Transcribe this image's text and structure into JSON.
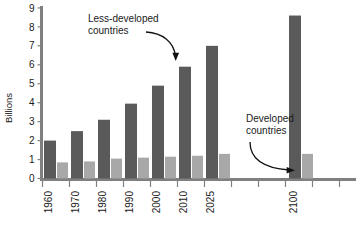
{
  "chart_data": {
    "type": "bar",
    "title": "",
    "xlabel": "",
    "ylabel": "Billions",
    "ylim": [
      0,
      9.4
    ],
    "yticks": [
      0,
      1,
      2,
      3,
      4,
      5,
      6,
      7,
      8,
      9
    ],
    "ytick_labels": [
      "0",
      "1",
      "2",
      "3",
      "4",
      "5",
      "6",
      "7",
      "8",
      "9"
    ],
    "grid": false,
    "legend_position": "annotations",
    "categories": [
      "1960",
      "1970",
      "1980",
      "1990",
      "2000",
      "2010",
      "2025",
      "2100"
    ],
    "series": [
      {
        "name": "Less-developed countries",
        "color": "#5a5a5a",
        "values": [
          2.0,
          2.5,
          3.1,
          3.95,
          4.9,
          5.9,
          7.0,
          8.6
        ]
      },
      {
        "name": "Developed countries",
        "color": "#a8a8a8",
        "values": [
          0.85,
          0.9,
          1.05,
          1.1,
          1.15,
          1.2,
          1.3,
          1.3
        ]
      }
    ],
    "annotations": [
      {
        "id": "less-developed",
        "text_line1": "Less-developed",
        "text_line2": "countries",
        "points_to": "2010 dark bar"
      },
      {
        "id": "developed",
        "text_line1": "Developed",
        "text_line2": "countries",
        "points_to": "2100 light bar"
      }
    ]
  },
  "axis": {
    "y_label": "Billions"
  }
}
